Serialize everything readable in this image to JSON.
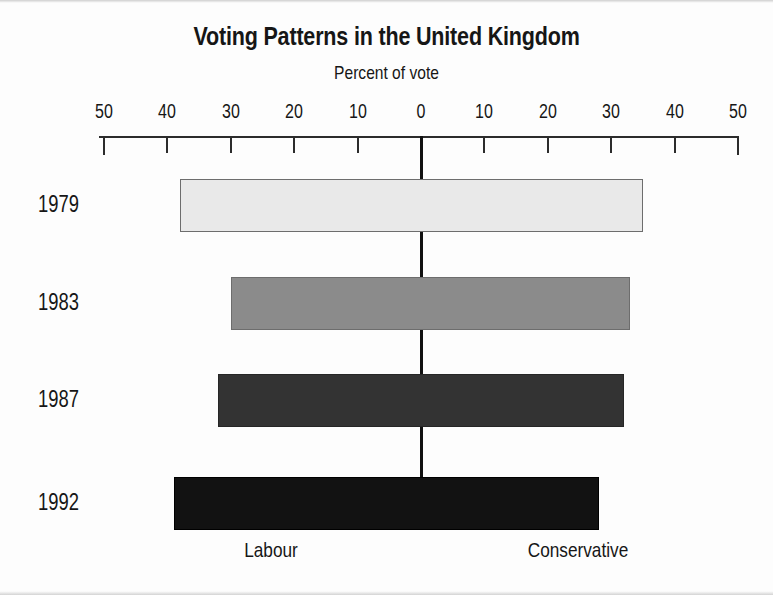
{
  "chart_data": {
    "type": "bar",
    "orientation": "horizontal",
    "style": "diverging-bidirectional",
    "title": "Voting Patterns in the United Kingdom",
    "subtitle": "Percent of vote",
    "xlabel": "Percent of vote",
    "ylabel": "",
    "categories": [
      "1979",
      "1983",
      "1987",
      "1992"
    ],
    "series": [
      {
        "name": "Labour",
        "direction": "left",
        "values": [
          38,
          30,
          32,
          39
        ]
      },
      {
        "name": "Conservative",
        "direction": "right",
        "values": [
          35,
          33,
          32,
          28
        ]
      }
    ],
    "xlim": [
      -50,
      50
    ],
    "axis_tick_values": [
      -50,
      -40,
      -30,
      -20,
      -10,
      0,
      10,
      20,
      30,
      40,
      50
    ],
    "axis_tick_labels": [
      "50",
      "40",
      "30",
      "20",
      "10",
      "0",
      "10",
      "20",
      "30",
      "40",
      "50"
    ],
    "grid": false,
    "legend": "none",
    "bar_fill_colors": [
      "#e9e9e9",
      "#8b8b8b",
      "#333333",
      "#121212"
    ],
    "axis_color": "#2c2c2c",
    "zero_line_color": "#111111"
  },
  "axis": {
    "ticks": [
      {
        "label": "50",
        "value": -50
      },
      {
        "label": "40",
        "value": -40
      },
      {
        "label": "30",
        "value": -30
      },
      {
        "label": "20",
        "value": -20
      },
      {
        "label": "10",
        "value": -10
      },
      {
        "label": "0",
        "value": 0
      },
      {
        "label": "10",
        "value": 10
      },
      {
        "label": "20",
        "value": 20
      },
      {
        "label": "30",
        "value": 30
      },
      {
        "label": "40",
        "value": 40
      },
      {
        "label": "50",
        "value": 50
      }
    ]
  },
  "rows": [
    {
      "year": "1979",
      "labour": 38,
      "conservative": 35,
      "fill": "#e9e9e9"
    },
    {
      "year": "1983",
      "labour": 30,
      "conservative": 33,
      "fill": "#8b8b8b"
    },
    {
      "year": "1987",
      "labour": 32,
      "conservative": 32,
      "fill": "#333333"
    },
    {
      "year": "1992",
      "labour": 39,
      "conservative": 28,
      "fill": "#121212"
    }
  ],
  "category_labels": {
    "left": "Labour",
    "right": "Conservative"
  },
  "colors": {
    "ink": "#161616",
    "axis": "#2c2c2c",
    "background": "#fdfdfd"
  }
}
